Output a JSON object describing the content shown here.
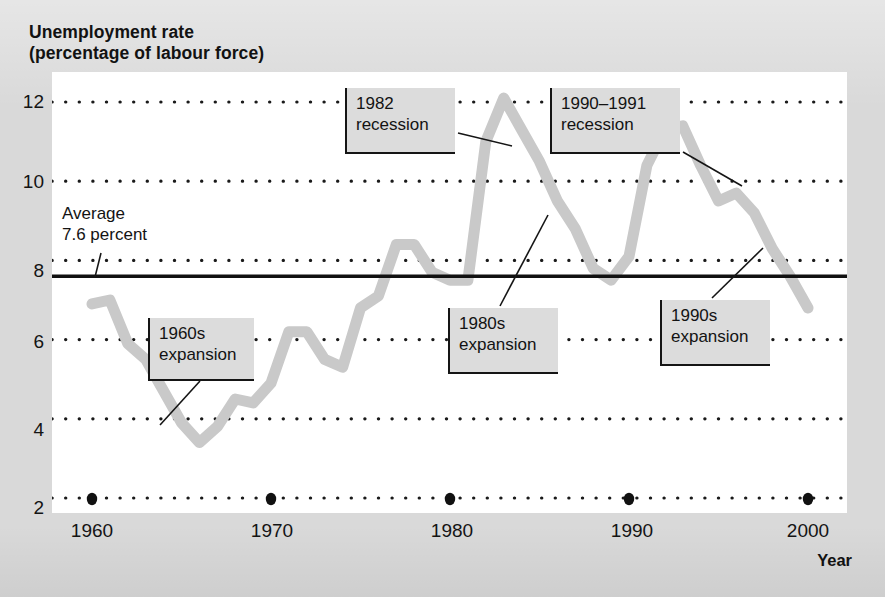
{
  "figure": {
    "title": "Unemployment rate\n(percentage of labour force)",
    "xaxis_title": "Year",
    "background_color": "#d9d9d9",
    "plot_color": "#ffffff",
    "line_color": "#c9c9c9",
    "average_line_color": "#111111",
    "gridline_color": "#1a1a1a"
  },
  "axis": {
    "y_ticks": [
      "2",
      "4",
      "6",
      "8",
      "10",
      "12"
    ],
    "x_ticks": [
      "1960",
      "1970",
      "1980",
      "1990",
      "2000"
    ]
  },
  "annotations": {
    "average": "Average\n7.6 percent",
    "expansion_1960s": "1960s\nexpansion",
    "recession_1982": "1982\nrecession",
    "recession_1990_1991": "1990–1991\nrecession",
    "expansion_1980s": "1980s\nexpansion",
    "expansion_1990s": "1990s\nexpansion"
  },
  "chart_data": {
    "type": "line",
    "title": "Unemployment rate (percentage of labour force)",
    "xlabel": "Year",
    "ylabel": "Unemployment rate (percentage of labour force)",
    "xlim": [
      1960,
      2000
    ],
    "ylim": [
      2,
      12.6
    ],
    "x_ticks": [
      1960,
      1970,
      1980,
      1990,
      2000
    ],
    "y_ticks": [
      2,
      4,
      6,
      8,
      10,
      12
    ],
    "grid": "horizontal dotted gridlines at each y tick",
    "legend": "none",
    "average_value": 7.6,
    "average_label": "Average 7.6 percent",
    "series": [
      {
        "name": "Unemployment rate",
        "x": [
          1960,
          1961,
          1962,
          1963,
          1964,
          1965,
          1966,
          1967,
          1968,
          1969,
          1970,
          1971,
          1972,
          1973,
          1974,
          1975,
          1976,
          1977,
          1978,
          1979,
          1980,
          1981,
          1982,
          1983,
          1984,
          1985,
          1986,
          1987,
          1988,
          1989,
          1990,
          1991,
          1992,
          1993,
          1994,
          1995,
          1996,
          1997,
          1998,
          1999,
          2000
        ],
        "values": [
          6.9,
          7.0,
          5.9,
          5.5,
          4.7,
          3.9,
          3.4,
          3.8,
          4.5,
          4.4,
          4.9,
          6.2,
          6.2,
          5.5,
          5.3,
          6.8,
          7.1,
          8.4,
          8.4,
          7.7,
          7.5,
          7.5,
          11.0,
          12.1,
          11.3,
          10.5,
          9.5,
          8.8,
          7.8,
          7.5,
          8.1,
          10.4,
          11.3,
          11.4,
          10.4,
          9.5,
          9.7,
          9.2,
          8.3,
          7.6,
          6.8
        ],
        "units": "percent",
        "style": "thick light-grey step/kinked line"
      }
    ],
    "callouts": [
      {
        "label": "1960s expansion",
        "points_to_year": 1965
      },
      {
        "label": "1982 recession",
        "points_to_year": 1982
      },
      {
        "label": "1990–1991 recession",
        "points_to_year": 1991
      },
      {
        "label": "1980s expansion",
        "points_to_year": 1986
      },
      {
        "label": "1990s expansion",
        "points_to_year": 1997
      }
    ]
  }
}
